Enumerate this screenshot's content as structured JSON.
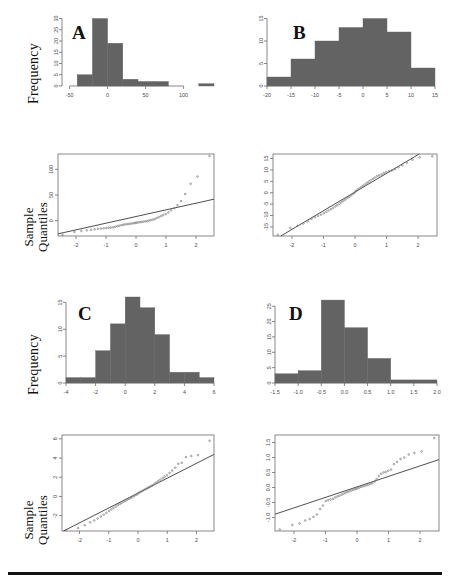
{
  "figure": {
    "axis_labels": {
      "frequency": "Frequency",
      "sample_quantiles_line1": "Sample",
      "sample_quantiles_line2": "Quantiles"
    },
    "panel_letters": [
      "A",
      "B",
      "C",
      "D"
    ],
    "colors": {
      "bar_fill": "#636363",
      "axis": "#6b6b6b",
      "point": "#7a7a7a",
      "qq_line": "#3a3a3a",
      "rule": "#111111",
      "text": "#4a4a4a"
    }
  },
  "chart_data": [
    {
      "id": "hist-a",
      "type": "bar",
      "title": "A",
      "xlabel": "",
      "ylabel": "Frequency",
      "xlim": [
        -60,
        140
      ],
      "ylim": [
        0,
        32
      ],
      "xticks": [
        -50,
        0,
        50,
        100
      ],
      "xtick_labels": [
        "-50",
        "0",
        "50",
        "100"
      ],
      "yticks": [
        0,
        5,
        10,
        15,
        20,
        25,
        30
      ],
      "ytick_labels": [
        "0",
        "5",
        "10",
        "15",
        "20",
        "25",
        "30"
      ],
      "bin_edges": [
        -60,
        -40,
        -20,
        0,
        20,
        40,
        60,
        80,
        100,
        120,
        140
      ],
      "values": [
        0,
        5,
        30,
        19,
        3,
        2,
        2,
        0,
        0,
        1
      ],
      "grid": false,
      "legend": "none",
      "note": "strongly right-skewed, long positive tail"
    },
    {
      "id": "hist-b",
      "type": "bar",
      "title": "B",
      "xlabel": "",
      "ylabel": "",
      "xlim": [
        -20,
        15
      ],
      "ylim": [
        0,
        16
      ],
      "xticks": [
        -20,
        -15,
        -10,
        -5,
        0,
        5,
        10,
        15
      ],
      "xtick_labels": [
        "-20",
        "-15",
        "-10",
        "-5",
        "0",
        "5",
        "10",
        "15"
      ],
      "yticks": [
        0,
        5,
        10,
        15
      ],
      "ytick_labels": [
        "0",
        "5",
        "10",
        "15"
      ],
      "bin_edges": [
        -20,
        -15,
        -10,
        -5,
        0,
        5,
        10,
        15
      ],
      "values": [
        2,
        6,
        10,
        13,
        15,
        12,
        4
      ],
      "grid": false,
      "legend": "none",
      "note": "approximately symmetric bell shape"
    },
    {
      "id": "hist-c",
      "type": "bar",
      "title": "C",
      "xlabel": "",
      "ylabel": "Frequency",
      "xlim": [
        -4,
        6
      ],
      "ylim": [
        0,
        16
      ],
      "xticks": [
        -4,
        -2,
        0,
        2,
        4,
        6
      ],
      "xtick_labels": [
        "-4",
        "-2",
        "0",
        "2",
        "4",
        "6"
      ],
      "yticks": [
        0,
        5,
        10,
        15
      ],
      "ytick_labels": [
        "0",
        "5",
        "10",
        "15"
      ],
      "bin_edges": [
        -4,
        -3,
        -2,
        -1,
        0,
        1,
        2,
        3,
        4,
        5,
        6
      ],
      "values": [
        1,
        1,
        6,
        11,
        16,
        14,
        9,
        2,
        2,
        1
      ],
      "grid": false,
      "legend": "none",
      "note": "mildly right-skewed"
    },
    {
      "id": "hist-d",
      "type": "bar",
      "title": "D",
      "xlabel": "",
      "ylabel": "",
      "xlim": [
        -1.5,
        2.0
      ],
      "ylim": [
        0,
        28
      ],
      "xticks": [
        -1.5,
        -1.0,
        -0.5,
        0.0,
        0.5,
        1.0,
        1.5,
        2.0
      ],
      "xtick_labels": [
        "-1.5",
        "-1.0",
        "-0.5",
        "0.0",
        "0.5",
        "1.0",
        "1.5",
        "2.0"
      ],
      "yticks": [
        0,
        5,
        10,
        15,
        20,
        25
      ],
      "ytick_labels": [
        "0",
        "5",
        "10",
        "15",
        "20",
        "25"
      ],
      "bin_edges": [
        -1.5,
        -1.0,
        -0.5,
        0.0,
        0.5,
        1.0,
        1.5,
        2.0
      ],
      "values": [
        3,
        4,
        27,
        18,
        8,
        1,
        1
      ],
      "grid": false,
      "legend": "none",
      "note": "sharply peaked, slight right tail"
    },
    {
      "id": "qq-a",
      "type": "scatter",
      "title": "",
      "xlabel": "",
      "ylabel": "Sample Quantiles",
      "xlim": [
        -2.6,
        2.6
      ],
      "ylim": [
        -30,
        130
      ],
      "xticks": [
        -2,
        -1,
        0,
        1,
        2
      ],
      "xtick_labels": [
        "-2",
        "-1",
        "0",
        "1",
        "2"
      ],
      "yticks": [
        0,
        50,
        100
      ],
      "ytick_labels": [
        "0",
        "50",
        "100"
      ],
      "reference_line": {
        "intercept": 8,
        "slope": 13
      },
      "x": [
        -2.45,
        -2.05,
        -1.82,
        -1.64,
        -1.5,
        -1.38,
        -1.27,
        -1.17,
        -1.08,
        -0.99,
        -0.91,
        -0.84,
        -0.76,
        -0.69,
        -0.62,
        -0.56,
        -0.49,
        -0.43,
        -0.37,
        -0.31,
        -0.25,
        -0.19,
        -0.13,
        -0.07,
        -0.02,
        0.02,
        0.07,
        0.13,
        0.19,
        0.25,
        0.31,
        0.37,
        0.43,
        0.49,
        0.56,
        0.62,
        0.69,
        0.76,
        0.84,
        0.91,
        0.99,
        1.08,
        1.17,
        1.27,
        1.38,
        1.5,
        1.64,
        1.82,
        2.05,
        2.45
      ],
      "y": [
        -28,
        -22,
        -20,
        -19,
        -18,
        -17,
        -16,
        -15.5,
        -15,
        -14.5,
        -14,
        -13.5,
        -13,
        -12,
        -11,
        -10,
        -9,
        -8,
        -7.5,
        -7,
        -6.5,
        -6,
        -5.5,
        -5,
        -4.5,
        -4,
        -3.5,
        -3,
        -2.5,
        -2,
        -1.5,
        -1,
        0,
        1,
        2,
        3,
        5,
        7,
        9,
        11,
        13,
        16,
        20,
        24,
        30,
        38,
        52,
        72,
        86,
        126
      ],
      "grid": false,
      "legend": "none",
      "note": "heavy right tail, points curve far above the line"
    },
    {
      "id": "qq-b",
      "type": "scatter",
      "title": "",
      "xlabel": "",
      "ylabel": "",
      "xlim": [
        -2.6,
        2.6
      ],
      "ylim": [
        -19,
        17
      ],
      "xticks": [
        -2,
        -1,
        0,
        1,
        2
      ],
      "xtick_labels": [
        "-2",
        "-1",
        "0",
        "1",
        "2"
      ],
      "yticks": [
        -15,
        -10,
        -5,
        0,
        5,
        10,
        15
      ],
      "ytick_labels": [
        "-15",
        "-10",
        "-5",
        "0",
        "5",
        "10",
        "15"
      ],
      "reference_line": {
        "intercept": 0.3,
        "slope": 8.2
      },
      "x": [
        -2.45,
        -2.05,
        -1.82,
        -1.64,
        -1.5,
        -1.38,
        -1.27,
        -1.17,
        -1.08,
        -0.99,
        -0.91,
        -0.84,
        -0.76,
        -0.69,
        -0.62,
        -0.56,
        -0.49,
        -0.43,
        -0.37,
        -0.31,
        -0.25,
        -0.19,
        -0.13,
        -0.07,
        -0.02,
        0.02,
        0.07,
        0.13,
        0.19,
        0.25,
        0.31,
        0.37,
        0.43,
        0.49,
        0.56,
        0.62,
        0.69,
        0.76,
        0.84,
        0.91,
        0.99,
        1.08,
        1.17,
        1.27,
        1.38,
        1.5,
        1.64,
        1.82,
        2.05,
        2.45
      ],
      "y": [
        -18.5,
        -15.5,
        -14.5,
        -13.5,
        -12.5,
        -11.5,
        -10.8,
        -10.2,
        -9.6,
        -9.0,
        -8.4,
        -7.8,
        -7.2,
        -6.6,
        -6.0,
        -5.4,
        -4.8,
        -4.2,
        -3.6,
        -3.0,
        -2.4,
        -1.8,
        -1.2,
        -0.6,
        0.0,
        0.6,
        1.2,
        1.8,
        2.4,
        3.0,
        3.6,
        4.2,
        4.8,
        5.4,
        6.0,
        6.6,
        7.2,
        7.6,
        8.0,
        8.6,
        9.0,
        9.4,
        9.8,
        10.4,
        11.2,
        12.0,
        13.2,
        14.5,
        15.5,
        16.0
      ],
      "grid": false,
      "legend": "none",
      "note": "points follow the reference line closely (near normal)"
    },
    {
      "id": "qq-c",
      "type": "scatter",
      "title": "",
      "xlabel": "",
      "ylabel": "Sample Quantiles",
      "xlim": [
        -2.6,
        2.6
      ],
      "ylim": [
        -3.6,
        6.4
      ],
      "xticks": [
        -2,
        -1,
        0,
        1,
        2
      ],
      "xtick_labels": [
        "-2",
        "-1",
        "0",
        "1",
        "2"
      ],
      "yticks": [
        -2,
        0,
        2,
        4,
        6
      ],
      "ytick_labels": [
        "-2",
        "0",
        "2",
        "4",
        "6"
      ],
      "reference_line": {
        "intercept": 0.35,
        "slope": 1.55
      },
      "x": [
        -2.45,
        -2.05,
        -1.82,
        -1.64,
        -1.5,
        -1.38,
        -1.27,
        -1.17,
        -1.08,
        -0.99,
        -0.91,
        -0.84,
        -0.76,
        -0.69,
        -0.62,
        -0.56,
        -0.49,
        -0.43,
        -0.37,
        -0.31,
        -0.25,
        -0.19,
        -0.13,
        -0.07,
        -0.02,
        0.02,
        0.07,
        0.13,
        0.19,
        0.25,
        0.31,
        0.37,
        0.43,
        0.49,
        0.56,
        0.62,
        0.69,
        0.76,
        0.84,
        0.91,
        0.99,
        1.08,
        1.17,
        1.27,
        1.38,
        1.5,
        1.64,
        1.82,
        2.05,
        2.45
      ],
      "y": [
        -3.5,
        -3.3,
        -3.0,
        -2.7,
        -2.5,
        -2.3,
        -2.1,
        -1.9,
        -1.7,
        -1.5,
        -1.35,
        -1.2,
        -1.05,
        -0.9,
        -0.78,
        -0.66,
        -0.55,
        -0.45,
        -0.35,
        -0.25,
        -0.15,
        -0.05,
        0.05,
        0.15,
        0.25,
        0.35,
        0.45,
        0.55,
        0.65,
        0.75,
        0.85,
        0.95,
        1.05,
        1.15,
        1.3,
        1.45,
        1.6,
        1.75,
        1.9,
        2.05,
        2.2,
        2.45,
        2.7,
        3.0,
        3.4,
        3.5,
        4.1,
        4.2,
        4.3,
        5.8
      ],
      "grid": false,
      "legend": "none",
      "note": "slight upward curve in the upper tail"
    },
    {
      "id": "qq-d",
      "type": "scatter",
      "title": "",
      "xlabel": "",
      "ylabel": "",
      "xlim": [
        -2.6,
        2.6
      ],
      "ylim": [
        -1.45,
        1.75
      ],
      "xticks": [
        -2,
        -1,
        0,
        1,
        2
      ],
      "xtick_labels": [
        "-2",
        "-1",
        "0",
        "1",
        "2"
      ],
      "yticks": [
        -1.0,
        -0.5,
        0.0,
        0.5,
        1.0,
        1.5
      ],
      "ytick_labels": [
        "-1.0",
        "-0.5",
        "0.0",
        "0.5",
        "1.0",
        "1.5"
      ],
      "reference_line": {
        "intercept": 0.02,
        "slope": 0.35
      },
      "x": [
        -2.45,
        -2.05,
        -1.82,
        -1.64,
        -1.5,
        -1.38,
        -1.27,
        -1.17,
        -1.08,
        -0.99,
        -0.91,
        -0.84,
        -0.76,
        -0.69,
        -0.62,
        -0.56,
        -0.49,
        -0.43,
        -0.37,
        -0.31,
        -0.25,
        -0.19,
        -0.13,
        -0.07,
        -0.02,
        0.02,
        0.07,
        0.13,
        0.19,
        0.25,
        0.31,
        0.37,
        0.43,
        0.49,
        0.56,
        0.62,
        0.69,
        0.76,
        0.84,
        0.91,
        0.99,
        1.08,
        1.17,
        1.27,
        1.38,
        1.5,
        1.64,
        1.82,
        2.05,
        2.45
      ],
      "y": [
        -1.4,
        -1.25,
        -1.2,
        -1.1,
        -1.05,
        -0.98,
        -0.9,
        -0.72,
        -0.6,
        -0.45,
        -0.42,
        -0.4,
        -0.38,
        -0.33,
        -0.3,
        -0.27,
        -0.24,
        -0.21,
        -0.18,
        -0.15,
        -0.13,
        -0.1,
        -0.08,
        -0.06,
        -0.04,
        -0.02,
        0.0,
        0.02,
        0.04,
        0.06,
        0.08,
        0.1,
        0.12,
        0.15,
        0.2,
        0.28,
        0.38,
        0.46,
        0.5,
        0.52,
        0.56,
        0.6,
        0.78,
        0.85,
        0.95,
        1.0,
        1.1,
        1.15,
        1.2,
        1.65
      ],
      "grid": false,
      "legend": "none",
      "note": "S-shaped deviation: low tail below line, high tail above"
    }
  ]
}
